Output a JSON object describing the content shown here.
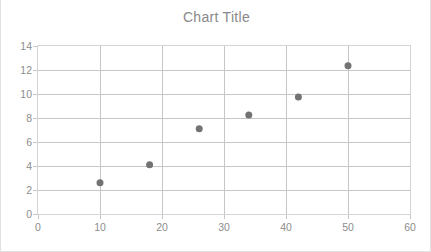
{
  "chart_data": {
    "type": "scatter",
    "title": "Chart Title",
    "xlabel": "",
    "ylabel": "",
    "xlim": [
      0,
      60
    ],
    "ylim": [
      0,
      14
    ],
    "x_ticks": [
      0,
      10,
      20,
      30,
      40,
      50,
      60
    ],
    "y_ticks": [
      0,
      2,
      4,
      6,
      8,
      10,
      12,
      14
    ],
    "x_tick_labels": [
      "0",
      "10",
      "20",
      "30",
      "40",
      "50",
      "60"
    ],
    "y_tick_labels": [
      "0",
      "2",
      "4",
      "6",
      "8",
      "10",
      "12",
      "14"
    ],
    "grid": true,
    "grid_axes": "both",
    "legend": false,
    "legend_position": "none",
    "series": [
      {
        "name": "Series 1",
        "marker": "circle",
        "marker_color": "#737373",
        "marker_size": 7,
        "points": [
          {
            "x": 10,
            "y": 2.6
          },
          {
            "x": 18,
            "y": 4.1
          },
          {
            "x": 26,
            "y": 7.1
          },
          {
            "x": 34,
            "y": 8.25
          },
          {
            "x": 42,
            "y": 9.75
          },
          {
            "x": 50,
            "y": 12.35
          }
        ]
      }
    ]
  },
  "colors": {
    "title": "#898989",
    "tick_label": "#8d8d8d",
    "gridline": "#c6c6c6",
    "plot_border": "#d4d4d4",
    "chart_border": "#e2e2e2",
    "marker": "#737373",
    "background": "#ffffff"
  }
}
